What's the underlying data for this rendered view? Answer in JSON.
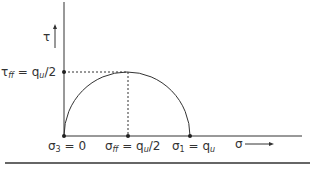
{
  "diagram": {
    "type": "mohr-circle-unconfined-compression",
    "y_axis_label": "τ",
    "x_axis_label": "σ",
    "tau_ff_label": {
      "sym": "τ",
      "sub": "ff",
      "eq": " = q",
      "sub2": "u",
      "tail": "/2"
    },
    "sigma3_label": {
      "sym": "σ",
      "sub": "3",
      "tail": " = 0"
    },
    "sigma_ff_label": {
      "sym": "σ",
      "sub": "ff",
      "eq": " = q",
      "sub2": "u",
      "tail": "/2"
    },
    "sigma1_label": {
      "sym": "σ",
      "sub": "1",
      "eq": " = q",
      "sub2": "u"
    },
    "colors": {
      "line": "#333333",
      "background": "#ffffff"
    }
  }
}
